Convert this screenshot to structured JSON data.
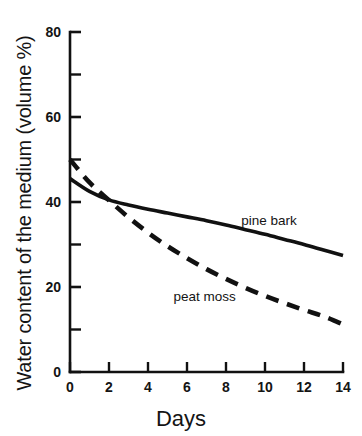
{
  "chart_data": {
    "type": "line",
    "title": "",
    "subtitle": "",
    "xlabel": "Days",
    "ylabel": "Water content of the medium (volume %)",
    "xlim": [
      0,
      14
    ],
    "ylim": [
      0,
      80
    ],
    "x_major_ticks": [
      0,
      2,
      4,
      6,
      8,
      10,
      12,
      14
    ],
    "x_tick_labels": [
      "0",
      "2",
      "4",
      "6",
      "8",
      "10",
      "12",
      "14"
    ],
    "y_major_ticks": [
      0,
      20,
      40,
      60,
      80
    ],
    "y_tick_labels": [
      "0",
      "20",
      "40",
      "60",
      "80"
    ],
    "y_minor_ticks": [
      10,
      30,
      50,
      70
    ],
    "grid": false,
    "legend_position": "inline-annotations",
    "x": [
      0,
      1,
      2,
      3,
      4,
      5,
      6,
      7,
      8,
      9,
      10,
      11,
      12,
      13,
      14
    ],
    "series": [
      {
        "name": "pine bark",
        "style": "solid",
        "color": "#111111",
        "label_x": 10.2,
        "label_y": 34.5,
        "values": [
          45.5,
          42.5,
          40.5,
          39.3,
          38.3,
          37.4,
          36.5,
          35.6,
          34.6,
          33.5,
          32.4,
          31.2,
          30.0,
          28.7,
          27.4
        ]
      },
      {
        "name": "peat moss",
        "style": "dashed",
        "color": "#111111",
        "label_x": 6.9,
        "label_y": 16.6,
        "values": [
          50.0,
          44.6,
          40.4,
          36.4,
          32.8,
          29.6,
          26.8,
          24.2,
          21.9,
          19.8,
          17.9,
          16.2,
          14.6,
          13.1,
          11.2
        ]
      }
    ],
    "annotations": [
      {
        "text": "pine bark",
        "series": "pine bark"
      },
      {
        "text": "peat moss",
        "series": "peat moss"
      }
    ]
  },
  "axes": {
    "axis_color": "#111111",
    "background": "#ffffff"
  }
}
